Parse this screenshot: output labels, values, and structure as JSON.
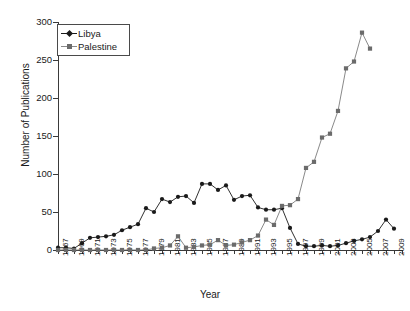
{
  "chart_data": {
    "type": "line",
    "title": "",
    "xlabel": "Year",
    "ylabel": "Number of Publications",
    "xlim": [
      1967,
      2010
    ],
    "ylim": [
      0,
      300
    ],
    "yticks": [
      0,
      50,
      100,
      150,
      200,
      250,
      300
    ],
    "xticks": [
      1967,
      1969,
      1971,
      1973,
      1975,
      1977,
      1979,
      1981,
      1983,
      1985,
      1987,
      1989,
      1991,
      1993,
      1995,
      1997,
      1999,
      2001,
      2003,
      2005,
      2007,
      2009
    ],
    "grid": false,
    "legend_position": "top-left",
    "x": [
      1967,
      1968,
      1969,
      1970,
      1971,
      1972,
      1973,
      1974,
      1975,
      1976,
      1977,
      1978,
      1979,
      1980,
      1981,
      1982,
      1983,
      1984,
      1985,
      1986,
      1987,
      1988,
      1989,
      1990,
      1991,
      1992,
      1993,
      1994,
      1995,
      1996,
      1997,
      1998,
      1999,
      2000,
      2001,
      2002,
      2003,
      2004,
      2005,
      2006,
      2007,
      2008,
      2009
    ],
    "series": [
      {
        "name": "Libya",
        "marker": "diamond",
        "color": "#1a1a1a",
        "values": [
          3,
          3,
          2,
          9,
          16,
          17,
          18,
          20,
          26,
          30,
          34,
          55,
          50,
          67,
          63,
          70,
          71,
          62,
          87,
          87,
          79,
          85,
          66,
          71,
          72,
          56,
          53,
          53,
          55,
          29,
          8,
          5,
          5,
          6,
          5,
          6,
          9,
          12,
          14,
          17,
          25,
          40,
          28
        ]
      },
      {
        "name": "Palestine",
        "marker": "square",
        "color": "#6b6b6b",
        "values": [
          0,
          0,
          0,
          0,
          0,
          0,
          0,
          0,
          0,
          0,
          0,
          0,
          2,
          3,
          6,
          18,
          3,
          4,
          6,
          7,
          13,
          6,
          7,
          10,
          13,
          19,
          40,
          33,
          58,
          59,
          67,
          108,
          116,
          148,
          153,
          183,
          239,
          248,
          286,
          265,
          0,
          0,
          0
        ]
      }
    ],
    "series_note": {
      "Palestine_x": [
        1967,
        1968,
        1969,
        1970,
        1971,
        1972,
        1973,
        1974,
        1975,
        1976,
        1977,
        1978,
        1979,
        1980,
        1981,
        1982,
        1983,
        1984,
        1985,
        1986,
        1987,
        1988,
        1989,
        1990,
        1991,
        1992,
        1993,
        1994,
        1995,
        1996,
        1997,
        1998,
        1999,
        2000,
        2001,
        2002,
        2003,
        2004,
        2005,
        2006
      ],
      "Palestine_values": [
        0,
        0,
        0,
        0,
        0,
        0,
        0,
        0,
        0,
        0,
        0,
        0,
        2,
        3,
        6,
        18,
        3,
        4,
        6,
        7,
        13,
        6,
        7,
        10,
        13,
        19,
        40,
        33,
        58,
        59,
        67,
        108,
        116,
        148,
        153,
        183,
        239,
        248,
        286,
        265
      ]
    }
  },
  "legend": {
    "entries": [
      {
        "label": "Libya",
        "marker": "diamond-icon"
      },
      {
        "label": "Palestine",
        "marker": "square-icon"
      }
    ]
  },
  "axes": {
    "y_title": "Number of Publications",
    "x_title": "Year"
  }
}
